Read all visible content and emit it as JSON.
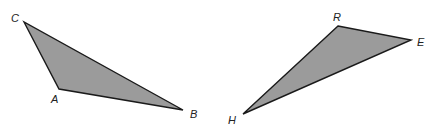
{
  "diagram": {
    "fill_color": "#9b9b9b",
    "stroke_color": "#1a1a1a",
    "triangles": [
      {
        "name": "CAB",
        "vertices": [
          {
            "label": "C",
            "x": 24,
            "y": 22,
            "lx": 11,
            "ly": 22
          },
          {
            "label": "A",
            "x": 59,
            "y": 89,
            "lx": 51,
            "ly": 103
          },
          {
            "label": "B",
            "x": 183,
            "y": 110,
            "lx": 190,
            "ly": 118
          }
        ]
      },
      {
        "name": "REH",
        "vertices": [
          {
            "label": "R",
            "x": 338,
            "y": 26,
            "lx": 333,
            "ly": 21
          },
          {
            "label": "E",
            "x": 411,
            "y": 40,
            "lx": 417,
            "ly": 46
          },
          {
            "label": "H",
            "x": 243,
            "y": 114,
            "lx": 228,
            "ly": 124
          }
        ]
      }
    ]
  }
}
